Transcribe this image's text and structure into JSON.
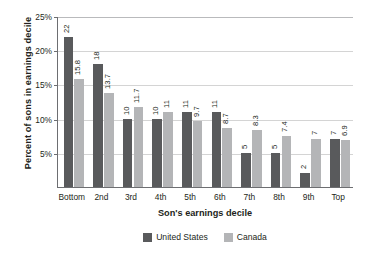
{
  "chart_data": {
    "type": "bar",
    "title": "",
    "xlabel": "Son's earnings decile",
    "ylabel": "Percent of sons in earnings decile",
    "categories": [
      "Bottom",
      "2nd",
      "3rd",
      "4th",
      "5th",
      "6th",
      "7th",
      "8th",
      "9th",
      "Top"
    ],
    "series": [
      {
        "name": "United States",
        "color": "#595a5c",
        "values": [
          22,
          18,
          10,
          10,
          11,
          11,
          5,
          5,
          2,
          7
        ],
        "labels": [
          "22",
          "18",
          "10",
          "10",
          "11",
          "11",
          "5",
          "5",
          "2",
          "7"
        ]
      },
      {
        "name": "Canada",
        "color": "#b4b5b7",
        "values": [
          15.8,
          13.7,
          11.7,
          11,
          9.7,
          8.7,
          8.3,
          7.4,
          7,
          6.9
        ],
        "labels": [
          "15.8",
          "13.7",
          "11.7",
          "11",
          "9.7",
          "8.7",
          "8.3",
          "7.4",
          "7",
          "6.9"
        ]
      }
    ],
    "ylim": [
      0,
      25
    ],
    "yticks": [
      5,
      10,
      15,
      20,
      25
    ],
    "ytick_labels": [
      "5%",
      "10%",
      "15%",
      "20%",
      "25%"
    ],
    "grid": true,
    "legend_position": "bottom"
  },
  "axes": {
    "y_title": "Percent of sons in earnings decile",
    "x_title": "Son's earnings decile"
  }
}
